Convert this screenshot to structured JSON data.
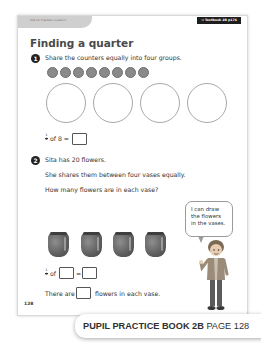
{
  "header": {
    "unit_tab": "Unit 14: Fractions, Lesson 3",
    "textbook_ref": "→ Textbook 2B p176"
  },
  "title": "Finding a quarter",
  "question1": {
    "number": "1",
    "instruction": "Share the counters equally into four groups.",
    "counters_count": 8,
    "groups_count": 4,
    "equation": {
      "numerator": "1",
      "denominator": "4",
      "text": "of 8 ="
    }
  },
  "question2": {
    "number": "2",
    "line1": "Sita has 20 flowers.",
    "line2": "She shares them between four vases equally.",
    "line3": "How many flowers are in each vase?",
    "vases_count": 4,
    "equation": {
      "numerator": "1",
      "denominator": "4",
      "of": "of",
      "equals": "="
    },
    "answer_sentence": {
      "before": "There are",
      "after": "flowers in each vase."
    },
    "speech_bubble": [
      "I can draw",
      "the flowers",
      "in the vases."
    ]
  },
  "page_number": "128",
  "banner": {
    "book": "PUPIL PRACTICE BOOK 2B",
    "page": "PAGE 128"
  },
  "colors": {
    "counter": "#8a8a8a",
    "vase": "#5d5d5d",
    "tab": "#cfcfcf",
    "badge": "#1e1e1e"
  }
}
